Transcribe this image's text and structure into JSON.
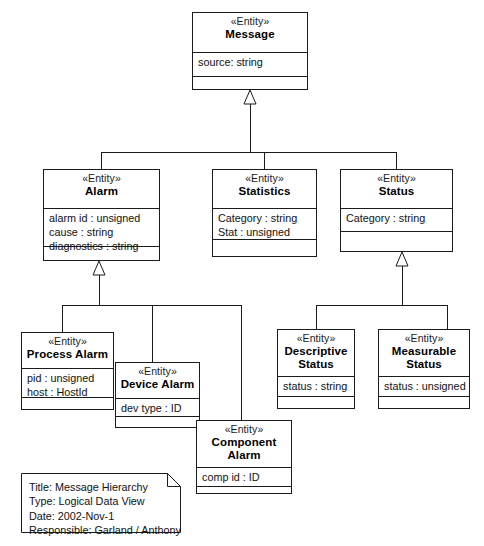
{
  "diagram": {
    "title": "Message Hierarchy",
    "kind": "uml-class-diagram",
    "stereotype_label": "«Entity»",
    "line_color": "#1b1b1b",
    "background_color": "#ffffff"
  },
  "classes": [
    {
      "id": "message",
      "stereotype": "«Entity»",
      "name": "Message",
      "name_lines": [
        "Message"
      ],
      "attributes": [
        "source: string"
      ],
      "operations": [],
      "x": 192,
      "y": 12,
      "w": 116,
      "h": 78,
      "header_h": 40,
      "attrs_h": 24
    },
    {
      "id": "alarm",
      "stereotype": "«Entity»",
      "name": "Alarm",
      "name_lines": [
        "Alarm"
      ],
      "attributes": [
        "alarm id : unsigned",
        "cause : string",
        "diagnostics : string"
      ],
      "operations": [],
      "x": 43,
      "y": 169,
      "w": 117,
      "h": 92,
      "header_h": 39,
      "attrs_h": 38
    },
    {
      "id": "statistics",
      "stereotype": "«Entity»",
      "name": "Statistics",
      "name_lines": [
        "Statistics"
      ],
      "attributes": [
        "Category : string",
        "Stat : unsigned"
      ],
      "operations": [],
      "x": 212,
      "y": 169,
      "w": 105,
      "h": 88,
      "header_h": 39,
      "attrs_h": 31
    },
    {
      "id": "status",
      "stereotype": "«Entity»",
      "name": "Status",
      "name_lines": [
        "Status"
      ],
      "attributes": [
        "Category : string"
      ],
      "operations": [],
      "x": 340,
      "y": 169,
      "w": 113,
      "h": 83,
      "header_h": 39,
      "attrs_h": 23
    },
    {
      "id": "process-alarm",
      "stereotype": "«Entity»",
      "name": "Process Alarm",
      "name_lines": [
        "Process Alarm"
      ],
      "attributes": [
        "pid : unsigned",
        "host : HostId"
      ],
      "operations": [],
      "x": 21,
      "y": 332,
      "w": 93,
      "h": 78,
      "header_h": 36,
      "attrs_h": 29
    },
    {
      "id": "device-alarm",
      "stereotype": "«Entity»",
      "name": "Device Alarm",
      "name_lines": [
        "Device Alarm"
      ],
      "attributes": [
        "dev type : ID"
      ],
      "operations": [],
      "x": 115,
      "y": 362,
      "w": 85,
      "h": 66,
      "header_h": 36,
      "attrs_h": 18
    },
    {
      "id": "component-alarm",
      "stereotype": "«Entity»",
      "name": "Component Alarm",
      "name_lines": [
        "Component",
        "Alarm"
      ],
      "attributes": [
        "comp id : ID"
      ],
      "operations": [],
      "x": 196,
      "y": 420,
      "w": 96,
      "h": 74,
      "header_h": 47,
      "attrs_h": 19
    },
    {
      "id": "descriptive-status",
      "stereotype": "«Entity»",
      "name": "Descriptive Status",
      "name_lines": [
        "Descriptive",
        "Status"
      ],
      "attributes": [
        "status : string"
      ],
      "operations": [],
      "x": 277,
      "y": 329,
      "w": 78,
      "h": 80,
      "header_h": 47,
      "attrs_h": 20
    },
    {
      "id": "measurable-status",
      "stereotype": "«Entity»",
      "name": "Measurable Status",
      "name_lines": [
        "Measurable",
        "Status"
      ],
      "attributes": [
        "status : unsigned"
      ],
      "operations": [],
      "x": 378,
      "y": 329,
      "w": 92,
      "h": 80,
      "header_h": 47,
      "attrs_h": 20
    }
  ],
  "generalizations": [
    {
      "id": "gen-message",
      "parent": "Message",
      "children": [
        "Alarm",
        "Statistics",
        "Status"
      ],
      "triangle_x": 250,
      "triangle_top_y": 90,
      "triangle_bottom_y": 104,
      "stem_bottom_y": 152,
      "bus_y": 152,
      "bus_x1": 101,
      "bus_x2": 396,
      "drops": [
        101,
        264,
        396
      ]
    },
    {
      "id": "gen-alarm",
      "parent": "Alarm",
      "children": [
        "Process Alarm",
        "Device Alarm",
        "Component Alarm"
      ],
      "triangle_x": 99,
      "triangle_top_y": 261,
      "triangle_bottom_y": 275,
      "stem_bottom_y": 305,
      "bus_y": 305,
      "bus_x1": 62,
      "bus_x2": 241,
      "drops": [
        62,
        152,
        241
      ]
    },
    {
      "id": "gen-status",
      "parent": "Status",
      "children": [
        "Descriptive Status",
        "Measurable Status"
      ],
      "triangle_x": 402,
      "triangle_top_y": 252,
      "triangle_bottom_y": 266,
      "stem_bottom_y": 305,
      "bus_y": 305,
      "bus_x1": 316,
      "bus_x2": 447,
      "drops": [
        316,
        447
      ]
    }
  ],
  "note": {
    "id": "diagram-note",
    "x": 21,
    "y": 473,
    "w": 160,
    "h": 60,
    "fold": 13,
    "lines": [
      "Title: Message Hierarchy",
      "Type: Logical Data View",
      "Date: 2002-Nov-1",
      "Responsible: Garland / Anthony"
    ],
    "fields": {
      "title_label": "Title:",
      "title_value": "Message Hierarchy",
      "type_label": "Type:",
      "type_value": "Logical Data View",
      "date_label": "Date:",
      "date_value": "2002-Nov-1",
      "responsible_label": "Responsible:",
      "responsible_value": "Garland / Anthony"
    }
  }
}
